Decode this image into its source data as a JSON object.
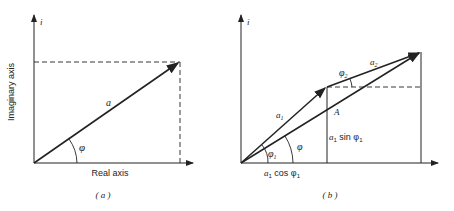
{
  "panel_a": {
    "caption": "( a )",
    "y_axis_symbol": "i",
    "y_axis_label": "Imaginary axis",
    "x_axis_label": "Real axis",
    "vector_label": "a",
    "angle_label": "φ"
  },
  "panel_b": {
    "caption": "( b )",
    "y_axis_symbol": "i",
    "vector1_label": "a",
    "vector1_sub": "1",
    "vector2_label": "a",
    "vector2_sub": "2",
    "resultant_label": "A",
    "angle1_label": "φ",
    "angle1_sub": "1",
    "angle2_label": "φ",
    "angle2_sub": "2",
    "angle_total_label": "φ",
    "vertical_component_label": "a",
    "vertical_component_sub": "1",
    "vertical_component_text": " sin φ",
    "vertical_component_sub2": "1",
    "horizontal_component_label": "a",
    "horizontal_component_sub": "1",
    "horizontal_component_text": " cos φ",
    "horizontal_component_sub2": "1"
  },
  "colors": {
    "ink": "#222222",
    "background": "#ffffff"
  }
}
